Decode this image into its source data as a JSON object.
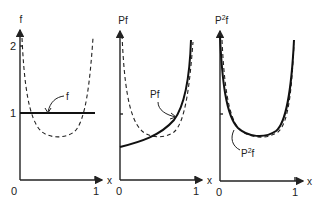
{
  "figure": {
    "panels": [
      {
        "id": "f",
        "y_label": "f",
        "x_label": "x",
        "origin_label": "0",
        "x_tick_label": "1",
        "y_tick_labels": [
          "1",
          "2"
        ],
        "curve_label": "f",
        "solid_curve": "constant f = 1 on [0,1]",
        "dashed_curve": "U-shaped reference curve, min about 0.65 near x=0.5, rising to about 2.1 at both ends"
      },
      {
        "id": "Pf",
        "y_label": "Pf",
        "x_label": "x",
        "origin_label": "0",
        "x_tick_label": "1",
        "curve_label": "Pf",
        "solid_curve": "increasing convex curve from about 0.5 at x=0 to large value near x=1",
        "dashed_curve": "same U-shaped reference curve"
      },
      {
        "id": "P2f",
        "y_label": "P²f",
        "y_label_base": "P",
        "y_label_sup": "2",
        "y_label_tail": "f",
        "x_label": "x",
        "origin_label": "0",
        "x_tick_label": "1",
        "curve_label_base": "P",
        "curve_label_sup": "2",
        "curve_label_tail": "f",
        "solid_curve": "U-shaped curve nearly coinciding with dashed reference",
        "dashed_curve": "same U-shaped reference curve"
      }
    ]
  }
}
